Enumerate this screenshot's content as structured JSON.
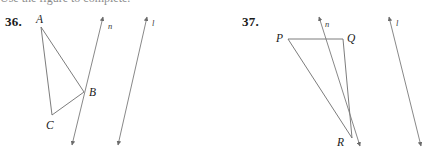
{
  "page": {
    "background": "#ffffff",
    "ink": "#5a5a5a",
    "text_color": "#1a1a1a",
    "width": 436,
    "height": 160,
    "cropped_header_text": "Use the figure to complete."
  },
  "problems": [
    {
      "id": "36",
      "number_label": "36.",
      "figure": {
        "type": "triangle-with-two-parallel-lines",
        "points": [
          {
            "name": "A",
            "label": "A",
            "x": 41,
            "y": 27,
            "label_x": 36,
            "label_y": 14
          },
          {
            "name": "B",
            "label": "B",
            "x": 84,
            "y": 92,
            "label_x": 89,
            "label_y": 87
          },
          {
            "name": "C",
            "label": "C",
            "x": 52,
            "y": 115,
            "label_x": 46,
            "label_y": 120
          }
        ],
        "segments": [
          {
            "from": "A",
            "to": "B"
          },
          {
            "from": "A",
            "to": "C"
          },
          {
            "from": "B",
            "to": "C"
          }
        ],
        "lines": [
          {
            "name": "n",
            "label": "n",
            "x1": 103,
            "y1": 17,
            "x2": 72,
            "y2": 145,
            "label_x": 108,
            "label_y": 22,
            "double_arrow": true
          },
          {
            "name": "l",
            "label": "l",
            "x1": 147,
            "y1": 17,
            "x2": 118,
            "y2": 145,
            "label_x": 152,
            "label_y": 19,
            "double_arrow": true
          }
        ]
      }
    },
    {
      "id": "37",
      "number_label": "37.",
      "figure": {
        "type": "triangle-with-two-parallel-lines",
        "points": [
          {
            "name": "P",
            "label": "P",
            "x": 288,
            "y": 39,
            "label_x": 276,
            "label_y": 33
          },
          {
            "name": "Q",
            "label": "Q",
            "x": 343,
            "y": 39,
            "label_x": 347,
            "label_y": 33
          },
          {
            "name": "R",
            "label": "R",
            "x": 352,
            "y": 138,
            "label_x": 337,
            "label_y": 137
          }
        ],
        "segments": [
          {
            "from": "P",
            "to": "Q"
          },
          {
            "from": "P",
            "to": "R"
          },
          {
            "from": "Q",
            "to": "R"
          }
        ],
        "lines": [
          {
            "name": "n",
            "label": "n",
            "x1": 319,
            "y1": 17,
            "x2": 360,
            "y2": 146,
            "label_x": 325,
            "label_y": 20,
            "double_arrow": true
          },
          {
            "name": "l",
            "label": "l",
            "x1": 389,
            "y1": 17,
            "x2": 421,
            "y2": 146,
            "label_x": 396,
            "label_y": 19,
            "double_arrow": true
          }
        ]
      }
    }
  ]
}
